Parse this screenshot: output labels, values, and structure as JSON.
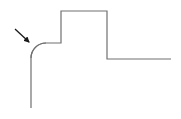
{
  "diagram": {
    "colors": {
      "outline": "#707070",
      "arrow": "#1a1a1a",
      "background": "#ffffff"
    },
    "elements": [
      {
        "id": "profile-outline",
        "kind": "polyline-with-fillet"
      },
      {
        "id": "fillet-pointer-arrow",
        "kind": "arrow",
        "points_to": "fillet-corner"
      }
    ]
  }
}
